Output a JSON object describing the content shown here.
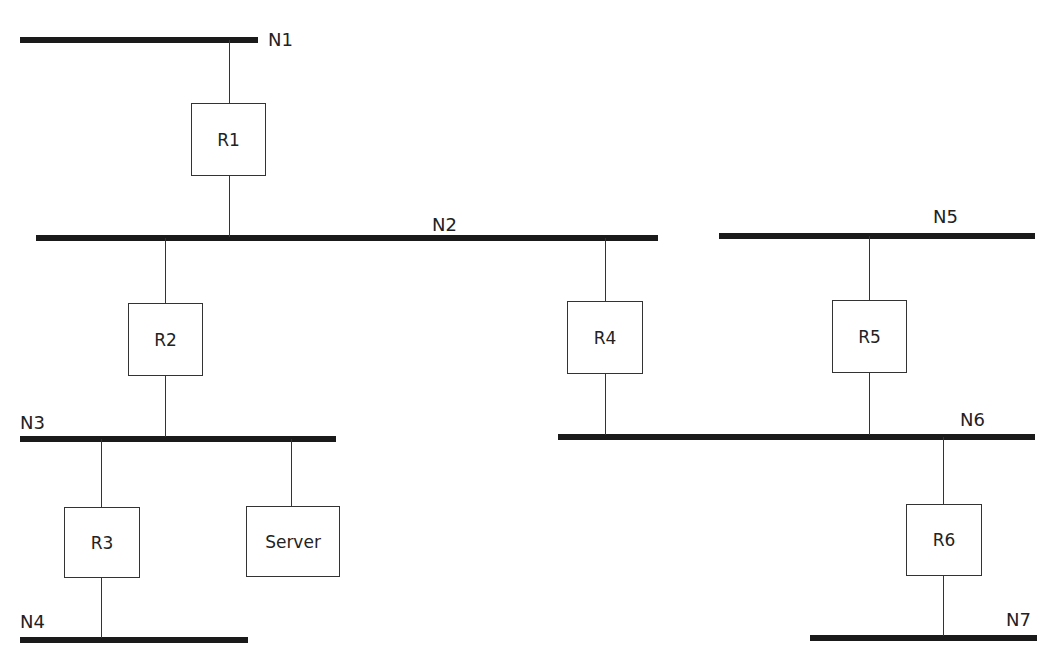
{
  "diagram": {
    "colors": {
      "bus": "#1a1a1a",
      "wire": "#333333",
      "box_border": "#333333",
      "text": "#222222"
    },
    "networks": [
      {
        "id": "N1",
        "label": "N1"
      },
      {
        "id": "N2",
        "label": "N2"
      },
      {
        "id": "N3",
        "label": "N3"
      },
      {
        "id": "N4",
        "label": "N4"
      },
      {
        "id": "N5",
        "label": "N5"
      },
      {
        "id": "N6",
        "label": "N6"
      },
      {
        "id": "N7",
        "label": "N7"
      }
    ],
    "devices": [
      {
        "id": "R1",
        "label": "R1",
        "connects": [
          "N1",
          "N2"
        ]
      },
      {
        "id": "R2",
        "label": "R2",
        "connects": [
          "N2",
          "N3"
        ]
      },
      {
        "id": "R3",
        "label": "R3",
        "connects": [
          "N3",
          "N4"
        ]
      },
      {
        "id": "Server",
        "label": "Server",
        "connects": [
          "N3"
        ]
      },
      {
        "id": "R4",
        "label": "R4",
        "connects": [
          "N2",
          "N6"
        ]
      },
      {
        "id": "R5",
        "label": "R5",
        "connects": [
          "N5",
          "N6"
        ]
      },
      {
        "id": "R6",
        "label": "R6",
        "connects": [
          "N6",
          "N7"
        ]
      }
    ]
  }
}
